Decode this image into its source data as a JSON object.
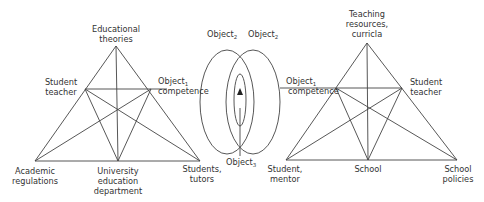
{
  "diagram": {
    "type": "activity-system-triangles",
    "colors": {
      "stroke": "#444444",
      "text": "#333333",
      "background": "#ffffff"
    },
    "left_triangle": {
      "apex": {
        "lines": [
          "Educational",
          "theories"
        ]
      },
      "left_mid": {
        "lines": [
          "Student",
          "teacher"
        ]
      },
      "right_mid": {
        "object": "Object",
        "subscript": "1",
        "line2": "competence"
      },
      "bottom_left": {
        "lines": [
          "Academic",
          "regulations"
        ]
      },
      "bottom_mid": {
        "lines": [
          "University",
          "education",
          "department"
        ]
      },
      "bottom_right": {
        "lines": [
          "Students,",
          "tutors"
        ]
      }
    },
    "center": {
      "left_object": {
        "object": "Object",
        "subscript": "2"
      },
      "right_object": {
        "object": "Object",
        "subscript": "2"
      },
      "shared_object": {
        "object": "Object",
        "subscript": "3"
      }
    },
    "right_triangle": {
      "apex": {
        "lines": [
          "Teaching",
          "resources,",
          "curricla"
        ]
      },
      "left_mid": {
        "object": "Object",
        "subscript": "1",
        "line2": "competence"
      },
      "right_mid": {
        "lines": [
          "Student",
          "teacher"
        ]
      },
      "bottom_left": {
        "lines": [
          "Student,",
          "mentor"
        ]
      },
      "bottom_mid": {
        "lines": [
          "School"
        ]
      },
      "bottom_right": {
        "lines": [
          "School",
          "policies"
        ]
      }
    }
  }
}
